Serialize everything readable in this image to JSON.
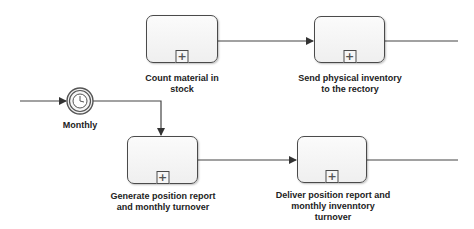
{
  "diagram": {
    "type": "BPMN process fragment",
    "colors": {
      "stroke": "#4a4a4a",
      "task_fill": "#f5f5f5",
      "text": "#222222"
    },
    "start_event": {
      "type": "timer-intermediate-event",
      "icon": "clock-icon",
      "label": "Monthly"
    },
    "tasks": [
      {
        "id": "t1",
        "label": "Count material in\nstock",
        "marker": "+"
      },
      {
        "id": "t2",
        "label": "Send physical inventory\nto the rectory",
        "marker": "+"
      },
      {
        "id": "t3",
        "label": "Generate position report\nand monthly turnover",
        "marker": "+"
      },
      {
        "id": "t4",
        "label": "Deliver position report and\nmonthly invenntory\nturnover",
        "marker": "+"
      }
    ]
  }
}
